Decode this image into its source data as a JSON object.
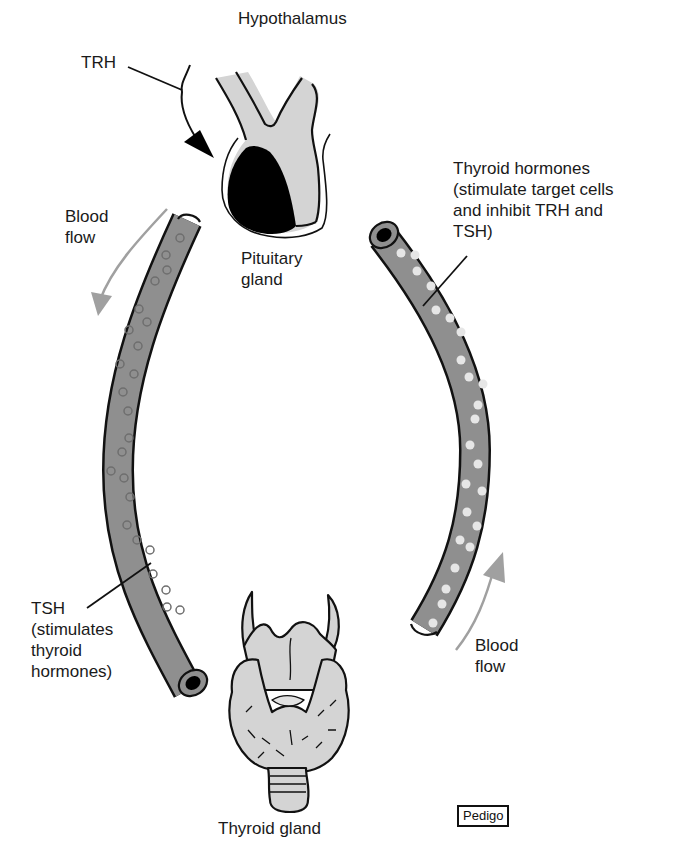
{
  "diagram": {
    "nodes": {
      "hypothalamus": {
        "label": "Hypothalamus"
      },
      "pituitary": {
        "label": "Pituitary\ngland"
      },
      "thyroid": {
        "label": "Thyroid gland"
      }
    },
    "signals": {
      "trh": {
        "label": "TRH"
      },
      "tsh": {
        "label": "TSH\n(stimulates\nthyroid\nhormones)"
      },
      "thyroid_hormones": {
        "label": "Thyroid hormones\n(stimulate target cells\nand inhibit TRH and\nTSH)"
      }
    },
    "flows": {
      "left": {
        "label": "Blood\nflow",
        "direction": "down"
      },
      "right": {
        "label": "Blood\nflow",
        "direction": "up"
      }
    },
    "credit": "Pedigo",
    "colors": {
      "vessel_fill": "#8f8f8f",
      "gland_fill": "#d4d4d4",
      "anterior_lobe": "#000000",
      "flow_arrow": "#a0a0a0",
      "tsh_particle_stroke": "#6e6e6e",
      "hormone_particle_fill": "#e6e6e6"
    }
  }
}
